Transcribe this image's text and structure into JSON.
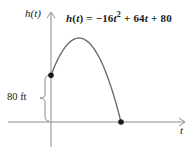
{
  "figure": {
    "ylabel": "h(t)",
    "xlabel": "t",
    "height_label": "80 ft",
    "formula_parts": [
      {
        "text": "h",
        "style": "italic"
      },
      {
        "text": "(",
        "style": "normal"
      },
      {
        "text": "t",
        "style": "italic"
      },
      {
        "text": ") = −16",
        "style": "normal"
      },
      {
        "text": "t",
        "style": "italic"
      },
      {
        "text": "2",
        "style": "sup"
      },
      {
        "text": " + 64",
        "style": "normal"
      },
      {
        "text": "t",
        "style": "italic"
      },
      {
        "text": " + 80",
        "style": "normal"
      }
    ]
  },
  "colors": {
    "background": "#ffffff",
    "axis": "#8c8c8c",
    "curve": "#6e6e6e",
    "point": "#1a1a1a",
    "text": "#1a1a1a"
  },
  "chart_data": {
    "type": "line",
    "equation": "h(t) = −16t² + 64t + 80",
    "coefficients": {
      "a": -16,
      "b": 64,
      "c": 80
    },
    "xlabel": "t",
    "ylabel": "h(t)",
    "t_range": [
      0,
      5
    ],
    "x": [
      0,
      0.5,
      1,
      1.5,
      2,
      2.5,
      3,
      3.5,
      4,
      4.5,
      5
    ],
    "y": [
      80,
      108,
      128,
      140,
      144,
      140,
      128,
      108,
      80,
      44,
      0
    ],
    "vertex": {
      "t": 2,
      "h": 144
    },
    "marked_points": [
      {
        "t": 0,
        "h": 80
      },
      {
        "t": 5,
        "h": 0
      }
    ],
    "annotations": [
      {
        "type": "brace",
        "label": "80 ft",
        "at_t": 0,
        "from_h": 0,
        "to_h": 80
      }
    ],
    "grid": false,
    "legend": false
  }
}
